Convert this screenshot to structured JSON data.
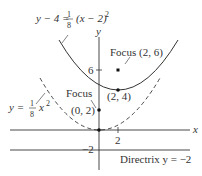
{
  "diagram": {
    "axes": {
      "x_label": "x",
      "y_label": "y"
    },
    "ticks": {
      "x_tick": "2",
      "y_tick_6": "6",
      "y_tick_neg2": "−2"
    },
    "solid_parabola": {
      "eq_left": "y − 4 = ",
      "frac_num": "1",
      "frac_den": "8",
      "eq_right": "(x − 2)",
      "exp": "2",
      "vertex_label": "(2, 4)",
      "focus_label": "Focus (2, 6)"
    },
    "dashed_parabola": {
      "eq_left": "y = ",
      "frac_num": "1",
      "frac_den": "8",
      "eq_right": "x",
      "exp": "2",
      "focus_word": "Focus",
      "focus_coords": "(0, 2)"
    },
    "directrix": {
      "label": "Directrix  y = −2"
    },
    "colors": {
      "stroke": "#333333",
      "background": "#ffffff"
    }
  }
}
